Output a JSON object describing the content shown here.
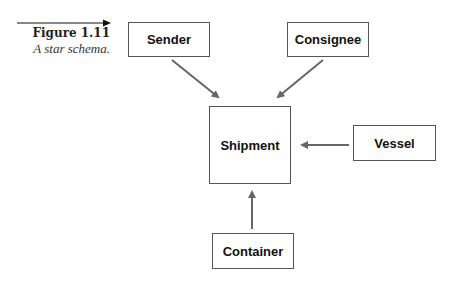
{
  "figure": {
    "number": "Figure 1.11",
    "caption": "A star schema."
  },
  "entities": {
    "sender": "Sender",
    "consignee": "Consignee",
    "shipment": "Shipment",
    "vessel": "Vessel",
    "container": "Container"
  },
  "colors": {
    "arrow": "#666666",
    "border": "#555555",
    "caption_arrow": "#111111"
  },
  "relationships": [
    {
      "from": "Sender",
      "to": "Shipment"
    },
    {
      "from": "Consignee",
      "to": "Shipment"
    },
    {
      "from": "Vessel",
      "to": "Shipment"
    },
    {
      "from": "Container",
      "to": "Shipment"
    }
  ]
}
